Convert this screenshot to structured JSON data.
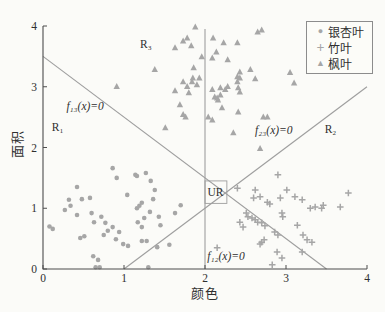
{
  "figure": {
    "background": "#fbfbf8",
    "marker_color": "#a6a6a6",
    "line_color": "#9e9e9e",
    "axis_color": "#4d4d4d",
    "text_color": "#2f2f2f"
  },
  "chart_data": {
    "type": "scatter",
    "title": "",
    "xlabel": "颜色",
    "ylabel": "面积",
    "xlim": [
      0,
      4
    ],
    "ylim": [
      0,
      4
    ],
    "xticks": [
      0,
      1,
      2,
      3,
      4
    ],
    "yticks": [
      0,
      1,
      2,
      3,
      4
    ],
    "grid": false,
    "legend_position": "upper right",
    "series": [
      {
        "id": "ginkgo",
        "name": "银杏叶",
        "marker": "circle",
        "points": [
          [
            0.08,
            0.7
          ],
          [
            0.12,
            0.66
          ],
          [
            0.27,
            0.97
          ],
          [
            0.32,
            1.14
          ],
          [
            0.34,
            1.04
          ],
          [
            0.42,
            1.35
          ],
          [
            0.42,
            0.89
          ],
          [
            0.46,
            0.51
          ],
          [
            0.48,
            1.15
          ],
          [
            0.51,
            0.54
          ],
          [
            0.58,
            1.17
          ],
          [
            0.6,
            0.92
          ],
          [
            0.62,
            0.21
          ],
          [
            0.63,
            0.77
          ],
          [
            0.65,
            0.03
          ],
          [
            0.68,
            0.15
          ],
          [
            0.7,
            0.03
          ],
          [
            0.72,
            0.86
          ],
          [
            0.75,
            0.56
          ],
          [
            0.77,
            0.76
          ],
          [
            0.8,
            0.63
          ],
          [
            0.86,
            1.66
          ],
          [
            0.86,
            0.69
          ],
          [
            0.9,
            0.49
          ],
          [
            0.91,
            1.5
          ],
          [
            0.94,
            0.61
          ],
          [
            0.99,
            0.41
          ],
          [
            1.04,
            1.22
          ],
          [
            1.05,
            0.38
          ],
          [
            1.14,
            1.55
          ],
          [
            1.16,
            1.53
          ],
          [
            1.16,
            1.0
          ],
          [
            1.19,
            1.04
          ],
          [
            1.22,
            1.09
          ],
          [
            1.22,
            0.46
          ],
          [
            1.25,
            0.84
          ],
          [
            1.27,
            1.58
          ],
          [
            1.28,
            0.46
          ],
          [
            1.3,
            0.03
          ],
          [
            1.32,
            0.94
          ],
          [
            1.33,
            1.45
          ],
          [
            1.36,
            1.15
          ],
          [
            1.38,
            1.3
          ],
          [
            1.17,
            0.77
          ],
          [
            1.22,
            0.69
          ],
          [
            1.41,
            0.36
          ],
          [
            1.43,
            0.86
          ],
          [
            1.45,
            0.72
          ],
          [
            1.56,
            0.4
          ],
          [
            1.63,
            0.92
          ],
          [
            1.7,
            1.05
          ]
        ]
      },
      {
        "id": "bamboo",
        "name": "竹叶",
        "marker": "plus",
        "points": [
          [
            2.15,
            0.35
          ],
          [
            2.4,
            1.33
          ],
          [
            2.43,
            0.77
          ],
          [
            2.47,
            0.69
          ],
          [
            2.51,
            0.92
          ],
          [
            2.53,
            0.86
          ],
          [
            2.58,
            0.84
          ],
          [
            2.6,
            1.17
          ],
          [
            2.62,
            1.3
          ],
          [
            2.62,
            0.81
          ],
          [
            2.65,
            0.77
          ],
          [
            2.68,
            1.19
          ],
          [
            2.68,
            0.41
          ],
          [
            2.7,
            0.76
          ],
          [
            2.7,
            0.44
          ],
          [
            2.73,
            0.48
          ],
          [
            2.74,
            0.71
          ],
          [
            2.77,
            1.1
          ],
          [
            2.8,
            1.07
          ],
          [
            2.83,
            0.07
          ],
          [
            2.86,
            0.61
          ],
          [
            2.89,
            0.28
          ],
          [
            2.9,
            1.55
          ],
          [
            2.9,
            0.56
          ],
          [
            2.93,
            1.17
          ],
          [
            2.95,
            0.92
          ],
          [
            2.95,
            0.18
          ],
          [
            2.96,
            0.86
          ],
          [
            3.01,
            1.3
          ],
          [
            3.11,
            1.19
          ],
          [
            3.14,
            0.72
          ],
          [
            3.2,
            1.14
          ],
          [
            3.2,
            0.28
          ],
          [
            3.21,
            0.56
          ],
          [
            3.26,
            0.48
          ],
          [
            3.3,
            1.0
          ],
          [
            3.32,
            0.44
          ],
          [
            3.36,
            1.02
          ],
          [
            3.44,
            1.0
          ],
          [
            3.46,
            1.05
          ],
          [
            3.67,
            1.02
          ],
          [
            3.77,
            1.25
          ]
        ]
      },
      {
        "id": "maple",
        "name": "枫叶",
        "marker": "triangle",
        "points": [
          [
            0.91,
            3.0
          ],
          [
            1.38,
            3.28
          ],
          [
            1.51,
            2.32
          ],
          [
            1.63,
            3.64
          ],
          [
            1.63,
            2.93
          ],
          [
            1.69,
            2.7
          ],
          [
            1.73,
            3.75
          ],
          [
            1.73,
            3.08
          ],
          [
            1.73,
            2.54
          ],
          [
            1.76,
            2.5
          ],
          [
            1.78,
            3.8
          ],
          [
            1.78,
            3.0
          ],
          [
            1.8,
            2.9
          ],
          [
            1.83,
            3.67
          ],
          [
            1.84,
            3.08
          ],
          [
            1.85,
            3.14
          ],
          [
            1.86,
            3.31
          ],
          [
            1.88,
            3.98
          ],
          [
            1.9,
            3.03
          ],
          [
            1.93,
            3.14
          ],
          [
            1.96,
            3.49
          ],
          [
            2.04,
            2.5
          ],
          [
            2.09,
            3.47
          ],
          [
            2.09,
            2.95
          ],
          [
            2.09,
            2.45
          ],
          [
            2.1,
            3.8
          ],
          [
            2.12,
            2.83
          ],
          [
            2.14,
            3.57
          ],
          [
            2.15,
            2.81
          ],
          [
            2.16,
            2.78
          ],
          [
            2.19,
            2.98
          ],
          [
            2.19,
            2.86
          ],
          [
            2.21,
            2.65
          ],
          [
            2.23,
            3.72
          ],
          [
            2.25,
            2.95
          ],
          [
            2.28,
            3.0
          ],
          [
            2.28,
            3.44
          ],
          [
            2.35,
            2.24
          ],
          [
            2.4,
            3.72
          ],
          [
            2.4,
            3.16
          ],
          [
            2.4,
            3.08
          ],
          [
            2.41,
            2.58
          ],
          [
            2.41,
            2.98
          ],
          [
            2.43,
            3.24
          ],
          [
            2.43,
            3.14
          ],
          [
            2.43,
            2.91
          ],
          [
            2.56,
            3.28
          ],
          [
            2.62,
            3.13
          ],
          [
            2.65,
            3.9
          ],
          [
            2.68,
            1.98
          ],
          [
            2.7,
            3.93
          ],
          [
            2.72,
            2.5
          ],
          [
            2.77,
            2.5
          ],
          [
            3.05,
            3.23
          ],
          [
            3.1,
            3.06
          ]
        ]
      }
    ],
    "boundary_lines": [
      {
        "name": "line-f13",
        "label": "f₁₃(x)=0",
        "from": [
          0,
          3.5
        ],
        "to": [
          3.5,
          0
        ]
      },
      {
        "name": "line-f23",
        "label": "f₂₃(x)=0",
        "from": [
          1,
          0
        ],
        "to": [
          4,
          3
        ]
      },
      {
        "name": "line-f12",
        "label": "f₁₂(x)=0",
        "from": [
          2,
          0
        ],
        "to": [
          2,
          3.95
        ]
      }
    ],
    "annotations": [
      {
        "name": "region-r1-label",
        "text": "R₁",
        "x": 0.18,
        "y": 2.33,
        "italic": false
      },
      {
        "name": "region-r2-label",
        "text": "R₂",
        "x": 3.55,
        "y": 2.3,
        "italic": false
      },
      {
        "name": "region-r3-label",
        "text": "R₃",
        "x": 1.27,
        "y": 3.7,
        "italic": false
      },
      {
        "name": "line-f13-label",
        "text": "f₁₃(x)=0",
        "x": 0.52,
        "y": 2.68,
        "italic": true
      },
      {
        "name": "line-f23-label",
        "text": "f₂₃(x)=0",
        "x": 2.85,
        "y": 2.28,
        "italic": true
      },
      {
        "name": "line-f12-label",
        "text": "f₁₂(x)=0",
        "x": 2.26,
        "y": 0.21,
        "italic": true
      },
      {
        "name": "ur-label",
        "text": "UR",
        "x": 2.13,
        "y": 1.26,
        "italic": false
      }
    ],
    "ur_box": {
      "x0": 2.0,
      "x1": 2.27,
      "y0": 1.08,
      "y1": 1.45
    }
  },
  "legend": {
    "marker_glyphs": {
      "circle": "●",
      "plus": "+",
      "triangle": "▲"
    }
  }
}
